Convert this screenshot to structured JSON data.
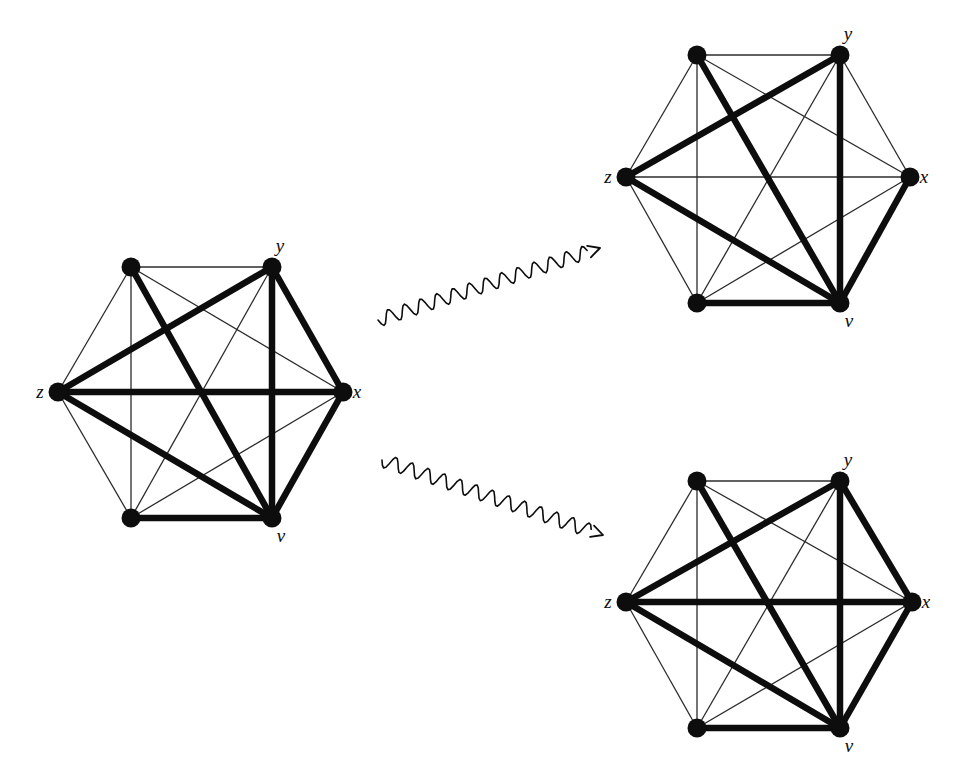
{
  "figure": {
    "kind": "graph-transformation-diagram",
    "background_color": "#ffffff",
    "ink_color": "#0d0d0d",
    "thin_edge_color": "#2b2b2b",
    "vertex_color": "#0d0d0d"
  },
  "style": {
    "vertex_radius": 9.5,
    "thin_width": 1.3,
    "thick_width": 6.5,
    "medium_width": 4.0
  },
  "graphs": [
    {
      "id": "source-graph",
      "name": "source-graph",
      "center": [
        200,
        392
      ],
      "radius": 142,
      "vertices": [
        {
          "id": "a",
          "label": "",
          "angle_deg": 120,
          "x": 131,
          "y": 267,
          "label_dx": 0,
          "label_dy": 0
        },
        {
          "id": "y",
          "label": "y",
          "angle_deg": 60,
          "x": 272,
          "y": 267,
          "label_dx": 8,
          "label_dy": -15
        },
        {
          "id": "x",
          "label": "x",
          "angle_deg": 0,
          "x": 343,
          "y": 392,
          "label_dx": 14,
          "label_dy": 6
        },
        {
          "id": "v",
          "label": "v",
          "angle_deg": 300,
          "x": 272,
          "y": 518,
          "label_dx": 9,
          "label_dy": 24
        },
        {
          "id": "b",
          "label": "",
          "angle_deg": 240,
          "x": 131,
          "y": 518,
          "label_dx": 0,
          "label_dy": 0
        },
        {
          "id": "z",
          "label": "z",
          "angle_deg": 180,
          "x": 58,
          "y": 392,
          "label_dx": -18,
          "label_dy": 6
        }
      ],
      "edges": [
        {
          "from": "a",
          "to": "y",
          "weight": "thin"
        },
        {
          "from": "y",
          "to": "x",
          "weight": "thick"
        },
        {
          "from": "x",
          "to": "v",
          "weight": "thick"
        },
        {
          "from": "v",
          "to": "b",
          "weight": "thick"
        },
        {
          "from": "b",
          "to": "z",
          "weight": "thin"
        },
        {
          "from": "z",
          "to": "a",
          "weight": "thin"
        },
        {
          "from": "a",
          "to": "x",
          "weight": "thin"
        },
        {
          "from": "a",
          "to": "v",
          "weight": "thick"
        },
        {
          "from": "a",
          "to": "b",
          "weight": "thin"
        },
        {
          "from": "y",
          "to": "v",
          "weight": "thick"
        },
        {
          "from": "y",
          "to": "b",
          "weight": "thin"
        },
        {
          "from": "y",
          "to": "z",
          "weight": "thick"
        },
        {
          "from": "x",
          "to": "b",
          "weight": "thin"
        },
        {
          "from": "x",
          "to": "z",
          "weight": "thick"
        },
        {
          "from": "v",
          "to": "z",
          "weight": "thick"
        }
      ]
    },
    {
      "id": "result-graph-top",
      "name": "result-graph-top",
      "center": [
        768,
        177
      ],
      "radius": 142,
      "vertices": [
        {
          "id": "a",
          "label": "",
          "angle_deg": 120,
          "x": 697,
          "y": 55,
          "label_dx": 0,
          "label_dy": 0
        },
        {
          "id": "y",
          "label": "y",
          "angle_deg": 60,
          "x": 840,
          "y": 55,
          "label_dx": 8,
          "label_dy": -15
        },
        {
          "id": "x",
          "label": "x",
          "angle_deg": 0,
          "x": 910,
          "y": 177,
          "label_dx": 14,
          "label_dy": 6
        },
        {
          "id": "v",
          "label": "v",
          "angle_deg": 300,
          "x": 840,
          "y": 303,
          "label_dx": 9,
          "label_dy": 24
        },
        {
          "id": "b",
          "label": "",
          "angle_deg": 240,
          "x": 697,
          "y": 303,
          "label_dx": 0,
          "label_dy": 0
        },
        {
          "id": "z",
          "label": "z",
          "angle_deg": 180,
          "x": 626,
          "y": 177,
          "label_dx": -18,
          "label_dy": 6
        }
      ],
      "edges": [
        {
          "from": "a",
          "to": "y",
          "weight": "thin"
        },
        {
          "from": "y",
          "to": "x",
          "weight": "thin"
        },
        {
          "from": "x",
          "to": "v",
          "weight": "thick"
        },
        {
          "from": "v",
          "to": "b",
          "weight": "thick"
        },
        {
          "from": "b",
          "to": "z",
          "weight": "thin"
        },
        {
          "from": "z",
          "to": "a",
          "weight": "thin"
        },
        {
          "from": "a",
          "to": "x",
          "weight": "thin"
        },
        {
          "from": "a",
          "to": "v",
          "weight": "thick"
        },
        {
          "from": "a",
          "to": "b",
          "weight": "thin"
        },
        {
          "from": "y",
          "to": "v",
          "weight": "thick"
        },
        {
          "from": "y",
          "to": "b",
          "weight": "thin"
        },
        {
          "from": "y",
          "to": "z",
          "weight": "thick"
        },
        {
          "from": "x",
          "to": "b",
          "weight": "thin"
        },
        {
          "from": "x",
          "to": "z",
          "weight": "thin"
        },
        {
          "from": "v",
          "to": "z",
          "weight": "thick"
        }
      ]
    },
    {
      "id": "result-graph-bottom",
      "name": "result-graph-bottom",
      "center": [
        768,
        602
      ],
      "radius": 142,
      "vertices": [
        {
          "id": "a",
          "label": "",
          "angle_deg": 120,
          "x": 697,
          "y": 481,
          "label_dx": 0,
          "label_dy": 0
        },
        {
          "id": "y",
          "label": "y",
          "angle_deg": 60,
          "x": 840,
          "y": 481,
          "label_dx": 8,
          "label_dy": -15
        },
        {
          "id": "x",
          "label": "x",
          "angle_deg": 0,
          "x": 912,
          "y": 602,
          "label_dx": 14,
          "label_dy": 6
        },
        {
          "id": "v",
          "label": "v",
          "angle_deg": 300,
          "x": 840,
          "y": 728,
          "label_dx": 9,
          "label_dy": 24
        },
        {
          "id": "b",
          "label": "",
          "angle_deg": 240,
          "x": 697,
          "y": 728,
          "label_dx": 0,
          "label_dy": 0
        },
        {
          "id": "z",
          "label": "z",
          "angle_deg": 180,
          "x": 626,
          "y": 602,
          "label_dx": -18,
          "label_dy": 6
        }
      ],
      "edges": [
        {
          "from": "a",
          "to": "y",
          "weight": "thin"
        },
        {
          "from": "y",
          "to": "x",
          "weight": "thick"
        },
        {
          "from": "x",
          "to": "v",
          "weight": "thick"
        },
        {
          "from": "v",
          "to": "b",
          "weight": "thick"
        },
        {
          "from": "b",
          "to": "z",
          "weight": "thin"
        },
        {
          "from": "z",
          "to": "a",
          "weight": "thin"
        },
        {
          "from": "a",
          "to": "x",
          "weight": "thin"
        },
        {
          "from": "a",
          "to": "v",
          "weight": "thick"
        },
        {
          "from": "a",
          "to": "b",
          "weight": "thin"
        },
        {
          "from": "y",
          "to": "v",
          "weight": "thick"
        },
        {
          "from": "y",
          "to": "b",
          "weight": "thin"
        },
        {
          "from": "y",
          "to": "z",
          "weight": "thick"
        },
        {
          "from": "x",
          "to": "b",
          "weight": "thin"
        },
        {
          "from": "x",
          "to": "z",
          "weight": "thick"
        },
        {
          "from": "v",
          "to": "z",
          "weight": "thick"
        }
      ]
    }
  ],
  "arrows": [
    {
      "id": "arrow-to-top",
      "name": "wavy-arrow-upper",
      "style": "wavy",
      "from": [
        378,
        320
      ],
      "to": [
        600,
        248
      ],
      "amplitude": 7,
      "wavelength": 17,
      "stroke_width": 1.6
    },
    {
      "id": "arrow-to-bottom",
      "name": "wavy-arrow-lower",
      "style": "wavy",
      "from": [
        382,
        460
      ],
      "to": [
        603,
        535
      ],
      "amplitude": 7,
      "wavelength": 17,
      "stroke_width": 1.6
    }
  ]
}
